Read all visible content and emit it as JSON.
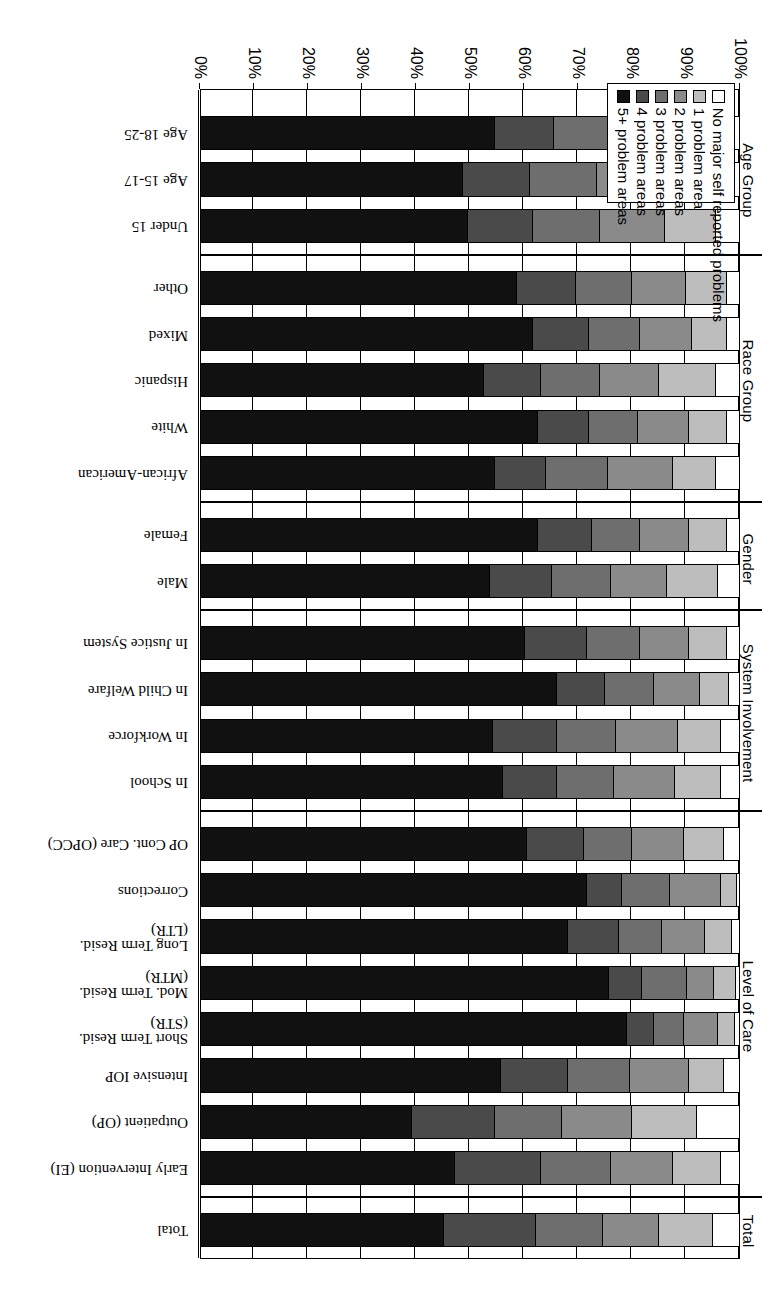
{
  "chart_data": {
    "type": "bar",
    "orientation": "horizontal-stacked",
    "title": "",
    "xlabel": "",
    "ylabel": "",
    "xlim": [
      0,
      100
    ],
    "grid": true,
    "axis_direction": "100% at left to 0% at right",
    "tick_labels": [
      "100%",
      "90%",
      "80%",
      "70%",
      "60%",
      "50%",
      "40%",
      "30%",
      "20%",
      "10%",
      "0%"
    ],
    "legend_position": "upper-right-inside",
    "series": [
      {
        "name": "No major self reported problems",
        "color": "#ffffff"
      },
      {
        "name": "1 problem area",
        "color": "#bdbdbd"
      },
      {
        "name": "2 problem areas",
        "color": "#8a8a8a"
      },
      {
        "name": "3 problem areas",
        "color": "#6e6e6e"
      },
      {
        "name": "4 problem areas",
        "color": "#4a4a4a"
      },
      {
        "name": "5+ problem areas",
        "color": "#111111"
      }
    ],
    "group_labels": [
      "Total",
      "Level of Care",
      "System Involvement",
      "Gender",
      "Race Group",
      "Age Group"
    ],
    "groups": [
      {
        "name": "Total",
        "categories": [
          "Total"
        ],
        "values": [
          [
            5.0,
            10.0,
            10.5,
            12.5,
            17.0,
            45.0
          ]
        ]
      },
      {
        "name": "Level of Care",
        "categories": [
          "Early Intervention (EI)",
          "Outpatient (OP)",
          "Intensive IOP",
          "Short Term Resid.\n(STR)",
          "Mod. Term Resid.\n(MTR)",
          "Long Term Resid.\n(LTR)",
          "Corrections",
          "OP Cont. Care (OPCC)"
        ],
        "values": [
          [
            3.5,
            9.0,
            11.5,
            13.0,
            16.0,
            47.0
          ],
          [
            8.0,
            12.0,
            13.0,
            12.5,
            15.5,
            39.0
          ],
          [
            3.0,
            6.5,
            11.0,
            11.5,
            12.5,
            55.5
          ],
          [
            1.0,
            3.0,
            6.5,
            5.5,
            5.0,
            79.0
          ],
          [
            0.8,
            4.0,
            5.0,
            8.5,
            6.0,
            75.7
          ],
          [
            1.5,
            5.0,
            8.0,
            8.0,
            9.5,
            68.0
          ],
          [
            0.5,
            3.0,
            9.5,
            9.0,
            6.5,
            71.5
          ],
          [
            3.0,
            7.5,
            9.5,
            9.0,
            10.5,
            60.5
          ]
        ]
      },
      {
        "name": "System Involvement",
        "categories": [
          "In School",
          "In Workforce",
          "In Child Welfare",
          "In Justice System"
        ],
        "values": [
          [
            3.5,
            8.5,
            11.5,
            10.5,
            10.0,
            56.0
          ],
          [
            3.5,
            8.0,
            11.5,
            11.0,
            12.0,
            54.0
          ],
          [
            2.0,
            5.5,
            8.5,
            9.0,
            9.0,
            66.0
          ],
          [
            2.5,
            7.0,
            9.0,
            10.0,
            11.5,
            60.0
          ]
        ]
      },
      {
        "name": "Gender",
        "categories": [
          "Male",
          "Female"
        ],
        "values": [
          [
            4.0,
            9.5,
            10.5,
            11.0,
            11.5,
            53.5
          ],
          [
            2.5,
            7.0,
            9.0,
            9.0,
            10.0,
            62.5
          ]
        ]
      },
      {
        "name": "Race Group",
        "categories": [
          "African-American",
          "White",
          "Hispanic",
          "Mixed",
          "Other"
        ],
        "values": [
          [
            4.5,
            8.0,
            12.0,
            11.5,
            9.5,
            54.5
          ],
          [
            2.5,
            7.0,
            9.5,
            9.0,
            9.5,
            62.5
          ],
          [
            4.5,
            10.5,
            11.0,
            11.0,
            10.5,
            52.5
          ],
          [
            2.5,
            6.5,
            9.5,
            9.5,
            10.5,
            61.5
          ],
          [
            2.5,
            7.5,
            10.0,
            10.5,
            11.0,
            58.5
          ]
        ]
      },
      {
        "name": "Age Group",
        "categories": [
          "Under 15",
          "Age 15-17",
          "Age 18-25"
        ],
        "values": [
          [
            4.5,
            9.5,
            12.0,
            12.5,
            12.0,
            49.5
          ],
          [
            4.5,
            10.0,
            12.0,
            12.5,
            12.5,
            48.5
          ],
          [
            3.5,
            8.0,
            11.5,
            11.5,
            11.0,
            54.5
          ]
        ]
      }
    ]
  },
  "legend": {
    "items": [
      "No major self reported problems",
      "1 problem area",
      "2 problem areas",
      "3 problem areas",
      "4 problem areas",
      "5+ problem areas"
    ]
  }
}
